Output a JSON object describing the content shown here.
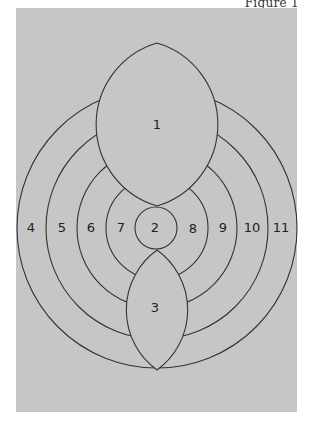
{
  "figure": {
    "label": "Figure 1",
    "panel_color": "#c6c6c6",
    "line_color": "#333333"
  },
  "regions": {
    "r1": "1",
    "r2": "2",
    "r3": "3",
    "r4": "4",
    "r5": "5",
    "r6": "6",
    "r7": "7",
    "r8": "8",
    "r9": "9",
    "r10": "10",
    "r11": "11"
  }
}
